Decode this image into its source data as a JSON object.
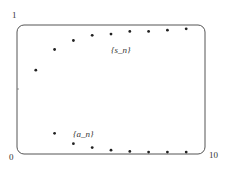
{
  "chart_data": {
    "type": "scatter",
    "title": "",
    "xlabel": "",
    "ylabel": "",
    "xlim": [
      0,
      10
    ],
    "ylim": [
      0,
      1
    ],
    "x_tick_labels": [
      "0",
      "10"
    ],
    "y_tick_labels": [
      "1"
    ],
    "grid": false,
    "legend": "inline annotations",
    "series": [
      {
        "name": "{s_n}",
        "x": [
          1,
          2,
          3,
          4,
          5,
          6,
          7,
          8,
          9
        ],
        "values": [
          0.65,
          0.81,
          0.88,
          0.92,
          0.93,
          0.95,
          0.95,
          0.96,
          0.97
        ]
      },
      {
        "name": "{a_n}",
        "x": [
          2,
          3,
          4,
          5,
          6,
          7,
          8,
          9
        ],
        "values": [
          0.16,
          0.08,
          0.05,
          0.03,
          0.02,
          0.015,
          0.015,
          0.015
        ]
      }
    ],
    "annotations": [
      {
        "text": "{s_n}",
        "x": 6.1,
        "y": 0.83
      },
      {
        "text": "{a_n}",
        "x": 3.2,
        "y": 0.17
      }
    ]
  }
}
